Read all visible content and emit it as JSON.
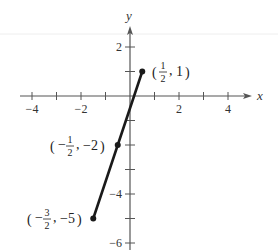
{
  "chart_data": {
    "type": "line",
    "title": "",
    "xlabel": "x",
    "ylabel": "y",
    "xlim": [
      -4.5,
      5
    ],
    "ylim": [
      -6,
      2.8
    ],
    "grid": false,
    "x_ticks": [
      -4,
      -3,
      -2,
      -1,
      1,
      2,
      3,
      4
    ],
    "x_tick_labels": {
      "-4": "−4",
      "-2": "−2",
      "2": "2",
      "4": "4"
    },
    "y_ticks": [
      2,
      1,
      -1,
      -2,
      -3,
      -4,
      -5,
      -6
    ],
    "y_tick_labels": {
      "2": "2",
      "-4": "−4",
      "-6": "−6"
    },
    "series": [
      {
        "name": "segment",
        "color": "#1a1a1a",
        "x": [
          -1.5,
          -0.5,
          0.5
        ],
        "y": [
          -5,
          -2,
          1
        ]
      }
    ],
    "annotations": [
      {
        "x": 0.5,
        "y": 1,
        "sign": "",
        "num": "1",
        "den": "2",
        "yval": "1",
        "text": "(1/2, 1)"
      },
      {
        "x": -0.5,
        "y": -2,
        "sign": "−",
        "num": "1",
        "den": "2",
        "yval": "−2",
        "text": "(−1/2, −2)"
      },
      {
        "x": -1.5,
        "y": -5,
        "sign": "−",
        "num": "3",
        "den": "2",
        "yval": "−5",
        "text": "(−3/2, −5)"
      }
    ]
  }
}
